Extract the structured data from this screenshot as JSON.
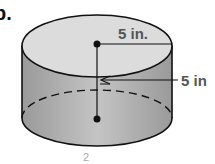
{
  "problem": {
    "label": "b."
  },
  "figure": {
    "shape": "cylinder",
    "radius_label": "5 in.",
    "height_label": "5 in",
    "footer_fragment": "2",
    "colors": {
      "top": "#d9d9d9",
      "side": "#a8a8a8",
      "outline": "#111111",
      "label": "#555555"
    }
  }
}
